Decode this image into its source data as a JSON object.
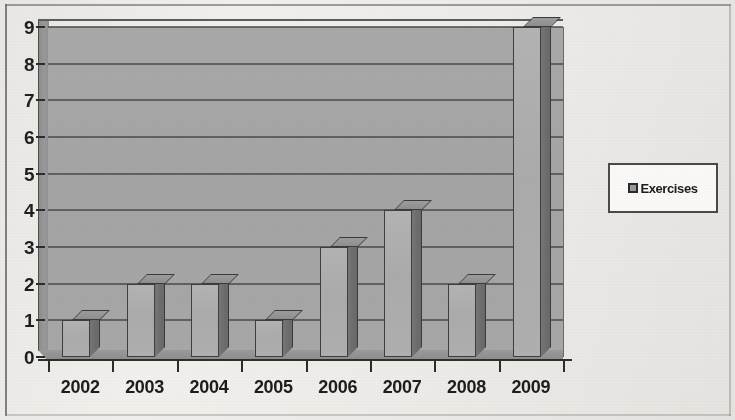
{
  "chart_data": {
    "type": "bar",
    "title": "",
    "xlabel": "",
    "ylabel": "",
    "categories": [
      "2002",
      "2003",
      "2004",
      "2005",
      "2006",
      "2007",
      "2008",
      "2009"
    ],
    "series": [
      {
        "name": "Exercises",
        "values": [
          1,
          2,
          2,
          1,
          3,
          4,
          2,
          9
        ]
      }
    ],
    "ylim": [
      0,
      9
    ],
    "y_ticks": [
      0,
      1,
      2,
      3,
      4,
      5,
      6,
      7,
      8,
      9
    ],
    "y_tick_labels": [
      "0",
      "1",
      "2",
      "3",
      "4",
      "5",
      "6",
      "7",
      "8",
      "9"
    ],
    "grid": true,
    "grid_axis": "y",
    "legend_position": "right",
    "legend_entries": [
      "Exercises"
    ],
    "style": "3d-bars-grayscale-scan",
    "colors": {
      "bar_front": "#b0b0b0",
      "bar_side": "#6d6d6d",
      "bar_top": "#949494",
      "plot_background": "#a8a8a8",
      "gridline": "#4a4a4a",
      "axis": "#2b2b2b",
      "text": "#1d1d1d",
      "page_background": "#f3f1ed",
      "legend_background": "#fbfaf8",
      "legend_border": "#4a4a4a"
    }
  },
  "legend": {
    "marker_icon": "legend-swatch-icon",
    "label": "Exercises"
  },
  "frame": {
    "border_icon": "page-frame-border"
  }
}
